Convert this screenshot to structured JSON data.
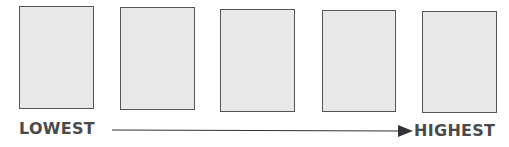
{
  "diagram": {
    "boxes": [
      {
        "id": 1,
        "x": 19,
        "y": 6,
        "w": 75,
        "h": 103
      },
      {
        "id": 2,
        "x": 120,
        "y": 7,
        "w": 75,
        "h": 103
      },
      {
        "id": 3,
        "x": 220,
        "y": 9,
        "w": 75,
        "h": 103
      },
      {
        "id": 4,
        "x": 322,
        "y": 10,
        "w": 74,
        "h": 102
      },
      {
        "id": 5,
        "x": 422,
        "y": 11,
        "w": 75,
        "h": 102
      }
    ],
    "scale": {
      "low_label": "LOWEST",
      "high_label": "HIGHEST"
    },
    "colors": {
      "box_fill": "#e8e8e8",
      "box_border": "#555555",
      "text": "#4a4a4a",
      "arrow": "#333333"
    }
  }
}
